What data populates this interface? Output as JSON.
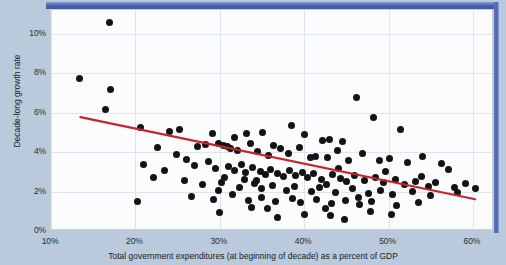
{
  "chart_data": {
    "type": "scatter",
    "title": "",
    "xlabel": "Total government expenditures (at beginning of decade) as a percent of GDP",
    "ylabel": "Decade-long growth rate",
    "xlim": [
      10,
      62.5
    ],
    "ylim": [
      0,
      11.2
    ],
    "xticks": [
      "10%",
      "20%",
      "30%",
      "40%",
      "50%",
      "60%"
    ],
    "xtick_values": [
      10,
      20,
      30,
      40,
      50,
      60
    ],
    "yticks": [
      "0%",
      "2%",
      "4%",
      "6%",
      "8%",
      "10%"
    ],
    "ytick_values": [
      0,
      2,
      4,
      6,
      8,
      10
    ],
    "grid": true,
    "legend": "none",
    "marker_color": "#131313",
    "trendline": {
      "name": "linear fit",
      "color": "#c8232b",
      "x": [
        13.5,
        60.5
      ],
      "y": [
        5.72,
        1.52
      ]
    },
    "points": [
      [
        16.9,
        10.55
      ],
      [
        13.4,
        7.75
      ],
      [
        17.0,
        7.15
      ],
      [
        16.5,
        6.15
      ],
      [
        46.2,
        6.75
      ],
      [
        48.2,
        5.75
      ],
      [
        20.6,
        5.25
      ],
      [
        24.0,
        5.05
      ],
      [
        25.2,
        5.15
      ],
      [
        29.1,
        4.95
      ],
      [
        31.8,
        4.75
      ],
      [
        33.2,
        4.95
      ],
      [
        35.1,
        5.0
      ],
      [
        38.5,
        5.35
      ],
      [
        40.1,
        4.9
      ],
      [
        42.2,
        4.6
      ],
      [
        43.0,
        4.65
      ],
      [
        44.6,
        4.55
      ],
      [
        51.4,
        5.15
      ],
      [
        22.6,
        4.25
      ],
      [
        24.9,
        3.9
      ],
      [
        27.4,
        4.3
      ],
      [
        28.3,
        4.4
      ],
      [
        29.9,
        4.45
      ],
      [
        30.5,
        4.35
      ],
      [
        30.9,
        4.3
      ],
      [
        31.3,
        4.2
      ],
      [
        32.1,
        4.1
      ],
      [
        33.6,
        4.45
      ],
      [
        34.5,
        4.05
      ],
      [
        35.8,
        3.85
      ],
      [
        36.4,
        4.35
      ],
      [
        37.2,
        4.2
      ],
      [
        38.1,
        3.95
      ],
      [
        39.4,
        4.25
      ],
      [
        40.7,
        3.75
      ],
      [
        41.3,
        3.8
      ],
      [
        42.8,
        3.7
      ],
      [
        44.0,
        4.1
      ],
      [
        45.3,
        3.55
      ],
      [
        46.9,
        3.95
      ],
      [
        48.9,
        3.55
      ],
      [
        50.1,
        3.65
      ],
      [
        52.2,
        3.45
      ],
      [
        54.0,
        3.8
      ],
      [
        56.3,
        3.4
      ],
      [
        57.1,
        3.1
      ],
      [
        21.0,
        3.35
      ],
      [
        23.4,
        3.05
      ],
      [
        26.1,
        3.6
      ],
      [
        27.0,
        3.3
      ],
      [
        28.7,
        3.5
      ],
      [
        29.5,
        3.15
      ],
      [
        31.0,
        3.25
      ],
      [
        31.7,
        3.05
      ],
      [
        32.6,
        3.35
      ],
      [
        33.1,
        2.95
      ],
      [
        33.9,
        3.2
      ],
      [
        34.8,
        3.0
      ],
      [
        35.4,
        2.85
      ],
      [
        36.0,
        3.1
      ],
      [
        36.8,
        2.9
      ],
      [
        37.5,
        2.75
      ],
      [
        38.3,
        3.05
      ],
      [
        39.0,
        2.8
      ],
      [
        39.8,
        2.95
      ],
      [
        40.4,
        2.7
      ],
      [
        41.1,
        2.9
      ],
      [
        42.0,
        2.6
      ],
      [
        43.4,
        2.85
      ],
      [
        44.3,
        2.65
      ],
      [
        45.0,
        2.5
      ],
      [
        46.0,
        2.8
      ],
      [
        47.2,
        2.55
      ],
      [
        48.5,
        2.7
      ],
      [
        49.4,
        2.45
      ],
      [
        50.8,
        2.6
      ],
      [
        51.9,
        2.35
      ],
      [
        53.2,
        2.5
      ],
      [
        54.7,
        2.25
      ],
      [
        55.6,
        2.45
      ],
      [
        57.8,
        2.2
      ],
      [
        59.1,
        2.4
      ],
      [
        60.3,
        2.15
      ],
      [
        25.8,
        2.55
      ],
      [
        28.0,
        2.35
      ],
      [
        30.2,
        2.45
      ],
      [
        32.3,
        2.2
      ],
      [
        34.1,
        2.4
      ],
      [
        35.0,
        2.15
      ],
      [
        36.2,
        2.3
      ],
      [
        37.9,
        2.05
      ],
      [
        38.8,
        2.25
      ],
      [
        40.9,
        2.0
      ],
      [
        41.8,
        2.2
      ],
      [
        43.7,
        1.95
      ],
      [
        45.7,
        2.15
      ],
      [
        47.6,
        1.9
      ],
      [
        49.0,
        2.05
      ],
      [
        50.5,
        1.85
      ],
      [
        52.8,
        2.0
      ],
      [
        55.0,
        1.8
      ],
      [
        26.7,
        1.75
      ],
      [
        29.3,
        1.6
      ],
      [
        31.5,
        1.85
      ],
      [
        33.4,
        1.55
      ],
      [
        34.9,
        1.7
      ],
      [
        36.6,
        1.5
      ],
      [
        38.6,
        1.65
      ],
      [
        39.6,
        1.45
      ],
      [
        41.5,
        1.6
      ],
      [
        43.2,
        1.4
      ],
      [
        44.9,
        1.55
      ],
      [
        46.6,
        1.35
      ],
      [
        48.0,
        1.5
      ],
      [
        51.0,
        1.3
      ],
      [
        53.6,
        1.45
      ],
      [
        20.2,
        1.5
      ],
      [
        30.0,
        0.95
      ],
      [
        36.9,
        0.7
      ],
      [
        40.0,
        0.85
      ],
      [
        43.1,
        0.8
      ],
      [
        44.8,
        0.6
      ],
      [
        50.4,
        0.85
      ],
      [
        33.8,
        1.2
      ],
      [
        42.5,
        1.15
      ],
      [
        47.9,
        1.0
      ],
      [
        22.1,
        2.7
      ],
      [
        29.8,
        2.05
      ],
      [
        35.6,
        1.15
      ],
      [
        44.1,
        3.15
      ],
      [
        46.4,
        1.7
      ],
      [
        49.7,
        3.0
      ],
      [
        53.9,
        2.75
      ],
      [
        58.2,
        1.95
      ],
      [
        42.6,
        2.35
      ],
      [
        30.6,
        2.7
      ],
      [
        32.9,
        2.6
      ],
      [
        34.3,
        2.55
      ]
    ]
  }
}
